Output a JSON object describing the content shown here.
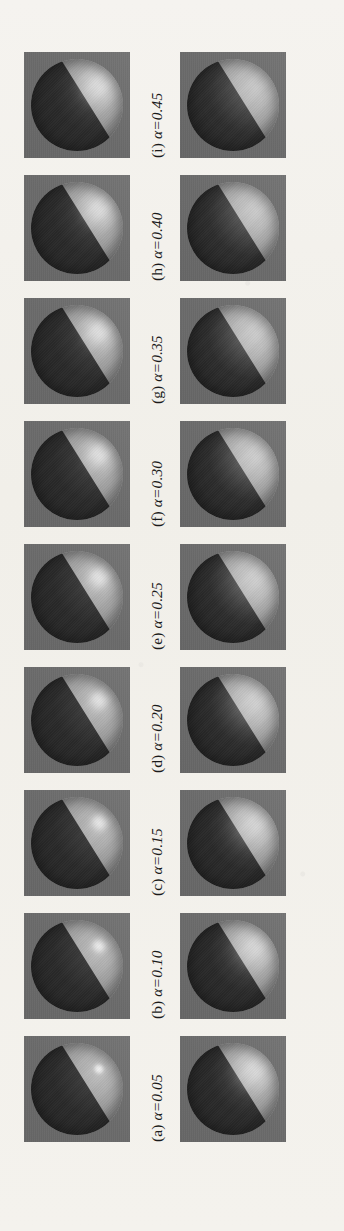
{
  "figure": {
    "orientation": "rotated-90-ccw",
    "page_background": "#f3f1ed",
    "tile_background": "#6e6e6e",
    "parameter_symbol": "α",
    "rows": [
      {
        "name": "row-1",
        "cells": [
          {
            "tag": "(a)",
            "alpha_label": "α=0.05",
            "alpha": 0.05
          },
          {
            "tag": "(b)",
            "alpha_label": "α=0.10",
            "alpha": 0.1
          },
          {
            "tag": "(c)",
            "alpha_label": "α=0.15",
            "alpha": 0.15
          },
          {
            "tag": "(d)",
            "alpha_label": "α=0.20",
            "alpha": 0.2
          },
          {
            "tag": "(e)",
            "alpha_label": "α=0.25",
            "alpha": 0.25
          },
          {
            "tag": "(f)",
            "alpha_label": "α=0.30",
            "alpha": 0.3
          },
          {
            "tag": "(g)",
            "alpha_label": "α=0.35",
            "alpha": 0.35
          },
          {
            "tag": "(h)",
            "alpha_label": "α=0.40",
            "alpha": 0.4
          },
          {
            "tag": "(i)",
            "alpha_label": "α=0.45",
            "alpha": 0.45
          }
        ]
      },
      {
        "name": "row-2",
        "cells": [
          {
            "tag": "(j)",
            "alpha_label": "α=0.50",
            "alpha": 0.5
          },
          {
            "tag": "(k)",
            "alpha_label": "α=0.55",
            "alpha": 0.55
          },
          {
            "tag": "(l)",
            "alpha_label": "α=0.60",
            "alpha": 0.6
          },
          {
            "tag": "(m)",
            "alpha_label": "α=0.75",
            "alpha": 0.75
          },
          {
            "tag": "(n)",
            "alpha_label": "α=0.80",
            "alpha": 0.8
          },
          {
            "tag": "(o)",
            "alpha_label": "α=0.85",
            "alpha": 0.85
          },
          {
            "tag": "(p)",
            "alpha_label": "α=0.90",
            "alpha": 0.9
          },
          {
            "tag": "(q)",
            "alpha_label": "α=0.95",
            "alpha": 0.95
          },
          {
            "tag": "(r)",
            "alpha_label": "α=1.00",
            "alpha": 1.0
          }
        ]
      }
    ]
  }
}
